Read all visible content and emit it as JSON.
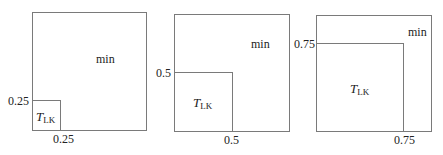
{
  "panels": [
    {
      "threshold": 0.25,
      "tick_x_label": "0.25",
      "tick_y_label": "0.25",
      "outer_region_label": "min",
      "inner_region_label": {
        "main": "T",
        "sub": "LK"
      }
    },
    {
      "threshold": 0.5,
      "tick_x_label": "0.5",
      "tick_y_label": "0.5",
      "outer_region_label": "min",
      "inner_region_label": {
        "main": "T",
        "sub": "LK"
      }
    },
    {
      "threshold": 0.75,
      "tick_x_label": "0.75",
      "tick_y_label": "0.75",
      "outer_region_label": "min",
      "inner_region_label": {
        "main": "T",
        "sub": "LK"
      }
    }
  ]
}
